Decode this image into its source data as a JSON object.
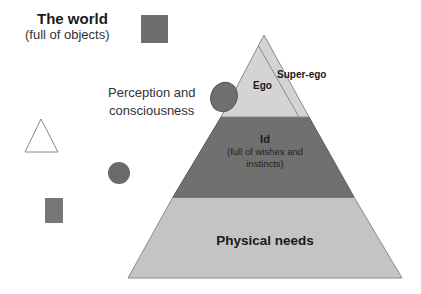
{
  "world": {
    "title": "The world",
    "subtitle": "(full of objects)"
  },
  "perception": {
    "line1": "Perception and",
    "line2": "consciousness"
  },
  "pyramid": {
    "ego": "Ego",
    "superego": "Super-ego",
    "id_title": "Id",
    "id_sub": "(full of wishes and instincts)",
    "physical": "Physical needs"
  },
  "colors": {
    "dark_gray": "#6e6e6e",
    "light_gray": "#c4c4c4",
    "lighter_gray": "#d6d6d6",
    "outline": "#8a8a8a"
  },
  "objects": [
    "square",
    "triangle",
    "circle",
    "rectangle",
    "ellipse"
  ]
}
